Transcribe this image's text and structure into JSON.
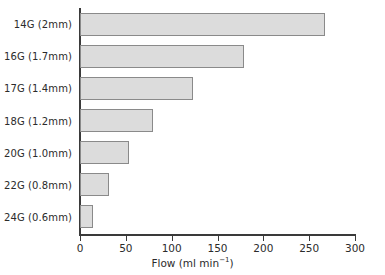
{
  "chart_data": {
    "type": "bar",
    "orientation": "horizontal",
    "title": "",
    "xlabel": "Flow (ml min⁻¹)",
    "ylabel": "",
    "xlim": [
      0,
      300
    ],
    "xticks": [
      0,
      50,
      100,
      150,
      200,
      250,
      300
    ],
    "grid": false,
    "legend": false,
    "categories": [
      "14G (2mm)",
      "16G (1.7mm)",
      "17G (1.4mm)",
      "18G (1.2mm)",
      "20G (1.0mm)",
      "22G (0.8mm)",
      "24G (0.6mm)"
    ],
    "values": [
      267,
      179,
      123,
      80,
      53,
      32,
      14
    ],
    "bar_fill_color": "#dcdcdc",
    "bar_edge_color": "#8a8a8a",
    "axis_color": "#3a3a3a"
  },
  "axis": {
    "title_main": "Flow (ml min",
    "title_superscript": "−1",
    "title_close": ")",
    "tick_labels": [
      "0",
      "50",
      "100",
      "150",
      "200",
      "250",
      "300"
    ]
  }
}
